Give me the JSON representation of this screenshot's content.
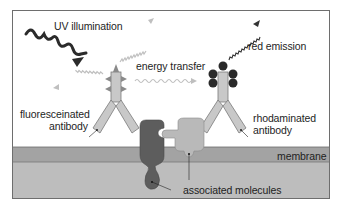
{
  "diagram": {
    "labels": {
      "uv_illumination": "UV illumination",
      "energy_transfer": "energy transfer",
      "red_emission": "red emission",
      "fluoresceinated_line1": "fluoresceinated",
      "fluoresceinated_line2": "antibody",
      "rhodaminated_line1": "rhodaminated",
      "rhodaminated_line2": "antibody",
      "membrane": "membrane",
      "associated_molecules": "associated molecules"
    },
    "colors": {
      "frame": "#6e6e6e",
      "membrane": "#a3a3a3",
      "cytoplasm": "#bdbdbd",
      "antibody_fill": "#c8c8c8",
      "antibody_stroke": "#7a7a7a",
      "dark_molecule": "#5d5d5d",
      "light_molecule": "#b9b9b9",
      "fluor_spikes": "#8a8a8a",
      "rhodamine_dots": "#2a2a2a",
      "uv_wave": "#2b2b2b",
      "scatter_wave": "#bfbfbf",
      "red_wave": "#333333"
    }
  }
}
